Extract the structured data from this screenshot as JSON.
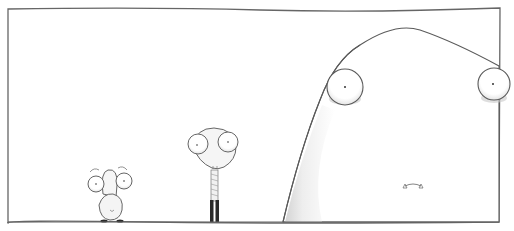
{
  "scene": {
    "description": "Comic panel: three pale creatures with bulging eyes in increasing size, left to right",
    "colors": {
      "background": "#ffffff",
      "line": "#555555",
      "shade": "#d8d8d8",
      "legs": "#2a2a2a"
    },
    "characters": [
      {
        "name": "small-creature",
        "position": "left"
      },
      {
        "name": "medium-creature",
        "position": "center"
      },
      {
        "name": "giant-creature",
        "position": "right"
      }
    ]
  }
}
